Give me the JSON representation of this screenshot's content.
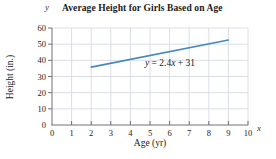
{
  "chart_data": {
    "type": "line",
    "title": "Average Height for Girls Based on Age",
    "xlabel": "Age (yr)",
    "ylabel": "Height (in.)",
    "x_axis_symbol": "x",
    "y_axis_symbol": "y",
    "equation": {
      "y_var": "y",
      "middle": " = 2.4",
      "x_var": "x",
      "tail": " + 31"
    },
    "xlim": [
      0,
      10
    ],
    "ylim": [
      0,
      60
    ],
    "x_ticks": [
      0,
      1,
      2,
      3,
      4,
      5,
      6,
      7,
      8,
      9,
      10
    ],
    "y_ticks": [
      0,
      10,
      20,
      30,
      40,
      50,
      60
    ],
    "grid": true,
    "legend": "none",
    "series": [
      {
        "name": "average-height-line",
        "x": [
          2,
          9
        ],
        "y": [
          35.8,
          52.6
        ],
        "color": "#4389bd"
      }
    ],
    "colors": {
      "grid": "#dadee4",
      "axis": "#6f7377",
      "text": "#222222",
      "line": "#4389bd",
      "background": "#ffffff"
    }
  }
}
